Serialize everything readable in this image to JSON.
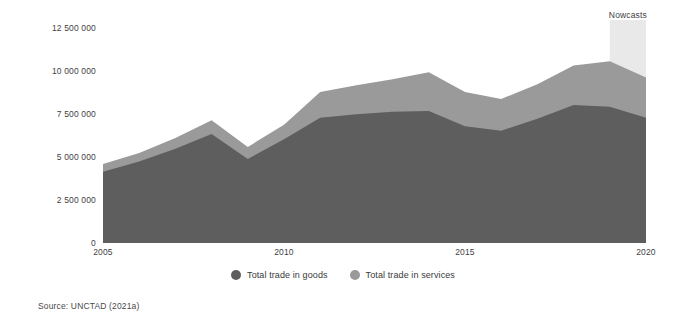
{
  "chart_data": {
    "type": "area",
    "stacked": true,
    "title": "",
    "subtitle": "",
    "xlabel": "",
    "ylabel": "",
    "x": [
      2005,
      2006,
      2007,
      2008,
      2009,
      2010,
      2011,
      2012,
      2013,
      2014,
      2015,
      2016,
      2017,
      2018,
      2019,
      2020
    ],
    "xlim": [
      2005,
      2020
    ],
    "ylim": [
      0,
      13000000
    ],
    "grid": false,
    "x_tick_labels": [
      "2005",
      "2010",
      "2015",
      "2020"
    ],
    "x_tick_values": [
      2005,
      2010,
      2015,
      2020
    ],
    "y_tick_labels": [
      "0",
      "2 500 000",
      "5 000 000",
      "7 500 000",
      "10 000 000",
      "12 500 000"
    ],
    "y_tick_values": [
      0,
      2500000,
      5000000,
      7500000,
      10000000,
      12500000
    ],
    "series": [
      {
        "name": "Total trade in goods",
        "color": "#5e5e5e",
        "values": [
          4150000,
          4750000,
          5500000,
          6350000,
          4900000,
          6050000,
          7300000,
          7500000,
          7650000,
          7700000,
          6800000,
          6550000,
          7250000,
          8050000,
          7950000,
          7300000
        ]
      },
      {
        "name": "Total trade in services",
        "color": "#9a9a9a",
        "values": [
          450000,
          500000,
          620000,
          800000,
          700000,
          850000,
          1500000,
          1700000,
          1900000,
          2250000,
          2000000,
          1850000,
          2000000,
          2300000,
          2650000,
          2350000
        ]
      }
    ],
    "annotations": [
      {
        "name": "nowcasts",
        "label": "Nowcasts",
        "type": "shaded-band",
        "x_start": 2019,
        "x_end": 2020,
        "color": "#e9e9e9"
      }
    ],
    "legend": {
      "position": "bottom-center",
      "entries": [
        {
          "label": "Total trade in goods",
          "color": "#5e5e5e"
        },
        {
          "label": "Total trade in services",
          "color": "#9a9a9a"
        }
      ]
    }
  },
  "nowcast": {
    "label": "Nowcasts"
  },
  "legend": {
    "goods_label": "Total trade in goods",
    "services_label": "Total trade in services"
  },
  "source": {
    "text": "Source: UNCTAD (2021a)"
  },
  "colors": {
    "goods": "#5e5e5e",
    "services": "#9a9a9a",
    "nowcast_band": "#e9e9e9",
    "background": "#ffffff",
    "text": "#3f3f3f"
  }
}
